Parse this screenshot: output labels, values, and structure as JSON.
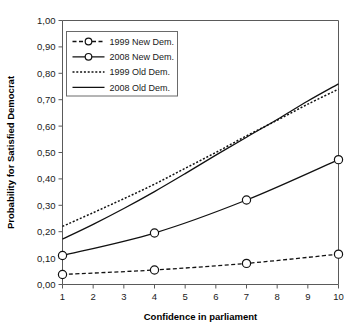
{
  "chart_data": {
    "type": "line",
    "title": "",
    "xlabel": "Confidence in parliament",
    "ylabel": "Probability for Satisfied Democrat",
    "xlim": [
      1,
      10
    ],
    "ylim": [
      0,
      1
    ],
    "grid": false,
    "legend_position": "top-left",
    "xticks": [
      "1",
      "2",
      "3",
      "4",
      "5",
      "6",
      "7",
      "8",
      "9",
      "10"
    ],
    "xtick_values": [
      1,
      2,
      3,
      4,
      5,
      6,
      7,
      8,
      9,
      10
    ],
    "yticks": [
      "0,00",
      "0,10",
      "0,20",
      "0,30",
      "0,40",
      "0,50",
      "0,60",
      "0,70",
      "0,80",
      "0,90",
      "1,00"
    ],
    "ytick_values": [
      0.0,
      0.1,
      0.2,
      0.3,
      0.4,
      0.5,
      0.6,
      0.7,
      0.8,
      0.9,
      1.0
    ],
    "series": [
      {
        "name": "1999 New Dem.",
        "style": "dashed",
        "markers": true,
        "x": [
          1,
          4,
          7,
          10
        ],
        "values": [
          0.038,
          0.055,
          0.08,
          0.115
        ]
      },
      {
        "name": "2008 New Dem.",
        "style": "solid",
        "markers": true,
        "x": [
          1,
          4,
          7,
          10
        ],
        "values": [
          0.11,
          0.195,
          0.32,
          0.473
        ]
      },
      {
        "name": "1999 Old Dem.",
        "style": "dotted",
        "markers": false,
        "x": [
          1,
          2,
          3,
          4,
          5,
          6,
          7,
          8,
          9,
          10
        ],
        "values": [
          0.22,
          0.272,
          0.325,
          0.38,
          0.44,
          0.5,
          0.563,
          0.622,
          0.683,
          0.74
        ]
      },
      {
        "name": "2008 Old Dem.",
        "style": "solid",
        "markers": false,
        "x": [
          1,
          2,
          3,
          4,
          5,
          6,
          7,
          8,
          9,
          10
        ],
        "values": [
          0.172,
          0.228,
          0.288,
          0.352,
          0.42,
          0.49,
          0.558,
          0.625,
          0.695,
          0.76
        ]
      }
    ]
  },
  "legend": {
    "entries": [
      {
        "label": "1999 New Dem."
      },
      {
        "label": "2008 New Dem."
      },
      {
        "label": "1999 Old Dem."
      },
      {
        "label": "2008 Old Dem."
      }
    ]
  },
  "colors": {
    "line": "#111111",
    "axis": "#5a5a5a",
    "text": "#1a1a1a",
    "background": "#ffffff"
  }
}
